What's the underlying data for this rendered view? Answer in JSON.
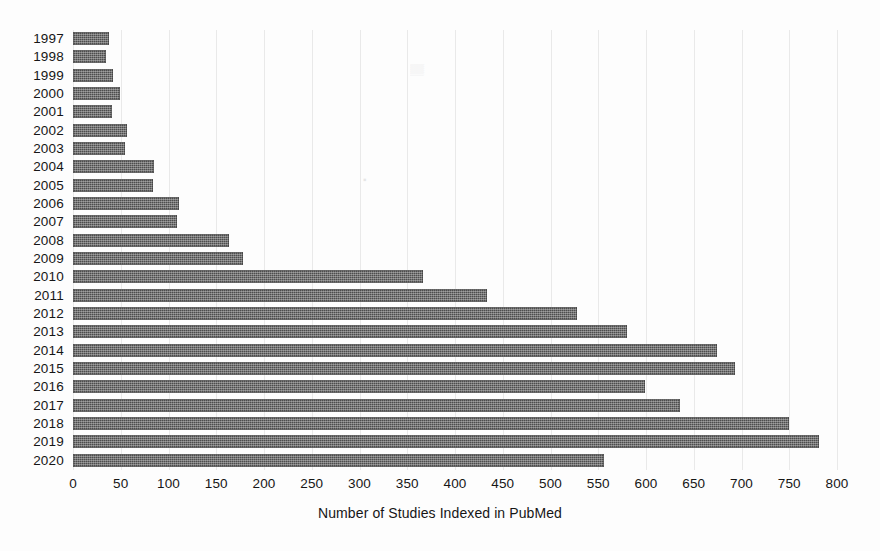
{
  "chart_data": {
    "type": "bar",
    "orientation": "horizontal",
    "title": "",
    "xlabel": "Number of Studies Indexed in PubMed",
    "ylabel": "",
    "categories": [
      "1997",
      "1998",
      "1999",
      "2000",
      "2001",
      "2002",
      "2003",
      "2004",
      "2005",
      "2006",
      "2007",
      "2008",
      "2009",
      "2010",
      "2011",
      "2012",
      "2013",
      "2014",
      "2015",
      "2016",
      "2017",
      "2018",
      "2019",
      "2020"
    ],
    "values": [
      38,
      35,
      42,
      49,
      41,
      57,
      54,
      85,
      84,
      111,
      109,
      163,
      178,
      366,
      434,
      528,
      580,
      674,
      693,
      599,
      636,
      750,
      781,
      556
    ],
    "xlim": [
      0,
      800
    ],
    "ylim": null,
    "xticks": [
      0,
      50,
      100,
      150,
      200,
      250,
      300,
      350,
      400,
      450,
      500,
      550,
      600,
      650,
      700,
      750,
      800
    ],
    "xtick_labels": [
      "0",
      "50",
      "100",
      "150",
      "200",
      "250",
      "300",
      "350",
      "400",
      "450",
      "500",
      "550",
      "600",
      "650",
      "700",
      "750",
      "800"
    ],
    "grid": true,
    "grid_axis": "x",
    "legend": null,
    "bar_color": "#4d4d4d",
    "bar_pattern": "dotted-hatch"
  },
  "axes": {
    "x_title": "Number of Studies Indexed in PubMed"
  }
}
